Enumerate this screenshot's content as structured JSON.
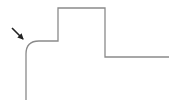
{
  "diagram": {
    "background": "#ffffff",
    "path": {
      "stroke": "#8a8a8a",
      "stroke_width": 1.3,
      "d": "M26 100 L26 54 Q26 41 39 41 L58 41 L58 8 L105 8 L105 57 L169 57"
    },
    "arrow": {
      "color": "#222222",
      "x1": 12,
      "y1": 28,
      "x2": 23,
      "y2": 39
    }
  }
}
